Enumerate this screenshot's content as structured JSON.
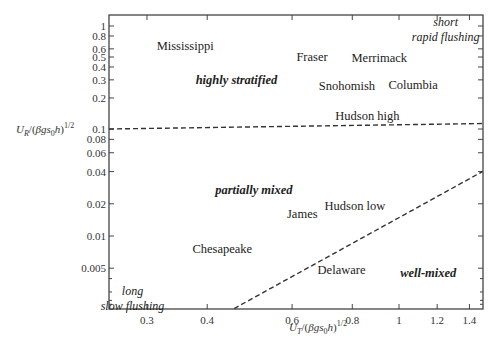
{
  "chart_data": {
    "type": "scatter",
    "title": "",
    "xlabel": "U_T/(βgs_0 h)^1/2",
    "ylabel": "U_R/(βgs_0 h)^1/2",
    "xscale": "log",
    "yscale": "log",
    "xlim": [
      0.25,
      1.49
    ],
    "ylim": [
      0.0021,
      1.28
    ],
    "grid": false,
    "x_ticks": [
      0.3,
      0.4,
      0.6,
      0.8,
      1,
      1.2,
      1.4
    ],
    "x_tick_labels": [
      "0.3",
      "0.4",
      "0.6",
      "0.8",
      "1",
      "1.2",
      "1.4"
    ],
    "y_ticks": [
      1,
      0.8,
      0.6,
      0.5,
      0.4,
      0.3,
      0.2,
      0.1,
      0.08,
      0.06,
      0.04,
      0.02,
      0.01,
      0.005
    ],
    "y_tick_labels": [
      "1",
      "0.8",
      "0.6",
      "0.5",
      "0.4",
      "0.3",
      "0.2",
      "0.1",
      "0.08",
      "0.06",
      "0.04",
      "0.02",
      "0.01",
      "0.005"
    ],
    "y_minor_ticks": [
      0.004,
      0.003,
      0.0025,
      0.0023
    ],
    "estuaries": [
      {
        "name": "Mississippi",
        "x": 0.36,
        "y": 0.64
      },
      {
        "name": "Fraser",
        "x": 0.66,
        "y": 0.5
      },
      {
        "name": "Merrimack",
        "x": 0.91,
        "y": 0.49
      },
      {
        "name": "Snohomish",
        "x": 0.78,
        "y": 0.26
      },
      {
        "name": "Columbia",
        "x": 1.07,
        "y": 0.27
      },
      {
        "name": "Hudson high",
        "x": 0.86,
        "y": 0.135
      },
      {
        "name": "James",
        "x": 0.63,
        "y": 0.016
      },
      {
        "name": "Hudson low",
        "x": 0.81,
        "y": 0.019
      },
      {
        "name": "Chesapeake",
        "x": 0.43,
        "y": 0.0075
      },
      {
        "name": "Delaware",
        "x": 0.76,
        "y": 0.0048
      }
    ],
    "regimes": [
      {
        "name": "highly stratified",
        "x": 0.46,
        "y": 0.3
      },
      {
        "name": "partially mixed",
        "x": 0.5,
        "y": 0.027
      },
      {
        "name": "well-mixed",
        "x": 1.15,
        "y": 0.0045
      }
    ],
    "annotations": [
      {
        "text": [
          "short",
          "rapid flushing"
        ],
        "x": 1.25,
        "y": 1.0,
        "position": "top-right"
      },
      {
        "text": [
          "long",
          "slow flushing"
        ],
        "x": 0.28,
        "y": 0.0028,
        "position": "bottom-left"
      }
    ],
    "boundaries": [
      {
        "name": "stratified / partially mixed",
        "style": "dashed",
        "points": [
          [
            0.25,
            0.1
          ],
          [
            1.49,
            0.113
          ]
        ]
      },
      {
        "name": "partially mixed / well-mixed",
        "style": "dashed",
        "points": [
          [
            0.455,
            0.0021
          ],
          [
            1.49,
            0.04
          ]
        ]
      }
    ]
  },
  "layout": {
    "plot": {
      "left": 109,
      "top": 15,
      "right": 483,
      "bottom": 309
    },
    "x_px_per_decade": 482,
    "x_ref": {
      "value": 1,
      "px": 399
    },
    "y_ref_points": [
      [
        1,
        26
      ],
      [
        0.1,
        129
      ],
      [
        0.01,
        236
      ]
    ]
  }
}
